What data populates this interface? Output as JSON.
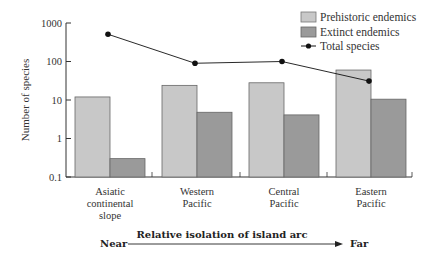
{
  "chart_data": {
    "type": "bar",
    "title": "",
    "xlabel": "Relative isolation of island arc",
    "ylabel": "Number of species",
    "yscale": "log",
    "ylim": [
      0.1,
      1000
    ],
    "yticks": [
      "0.1",
      "1",
      "10",
      "100",
      "1000"
    ],
    "categories": [
      [
        "Asiatic",
        "continental",
        "slope"
      ],
      [
        "Western",
        "Pacific"
      ],
      [
        "Central",
        "Pacific"
      ],
      [
        "Eastern",
        "Pacific"
      ]
    ],
    "series": [
      {
        "name": "Prehistoric endemics",
        "type": "bar",
        "color": "#c8c8c8",
        "values": [
          12,
          24,
          28,
          60
        ]
      },
      {
        "name": "Extinct endemics",
        "type": "bar",
        "color": "#9a9a9a",
        "values": [
          0.3,
          4.8,
          4.1,
          10.5
        ]
      },
      {
        "name": "Total species",
        "type": "line",
        "color": "#111111",
        "values": [
          510,
          90,
          100,
          31
        ]
      }
    ],
    "legend_position": "top-right",
    "grid": false,
    "axis_annotation": {
      "near": "Near",
      "far": "Far",
      "arrow_label": "Relative isolation of island arc"
    }
  },
  "labels": {
    "ylabel": "Number of species",
    "near": "Near",
    "far": "Far",
    "arrow_label": "Relative isolation of island arc",
    "legend": [
      "Prehistoric endemics",
      "Extinct endemics",
      "Total species"
    ]
  }
}
